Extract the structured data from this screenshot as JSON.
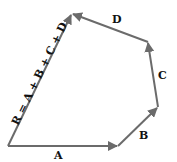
{
  "diagram": {
    "colors": {
      "vector": "#6b6b6b",
      "text": "#111111",
      "background": "#ffffff"
    },
    "vectors": [
      {
        "id": "A",
        "label": "A",
        "from": [
          8,
          146
        ],
        "to": [
          118,
          146
        ]
      },
      {
        "id": "B",
        "label": "B",
        "from": [
          118,
          146
        ],
        "to": [
          158,
          107
        ]
      },
      {
        "id": "C",
        "label": "C",
        "from": [
          158,
          107
        ],
        "to": [
          148,
          42
        ]
      },
      {
        "id": "D",
        "label": "D",
        "from": [
          148,
          42
        ],
        "to": [
          72,
          14
        ]
      },
      {
        "id": "R",
        "label": "R = A + B + C + D",
        "from": [
          8,
          146
        ],
        "to": [
          72,
          14
        ]
      }
    ],
    "labels": {
      "A": "A",
      "B": "B",
      "C": "C",
      "D": "D",
      "R": "R = A + B + C + D"
    }
  }
}
